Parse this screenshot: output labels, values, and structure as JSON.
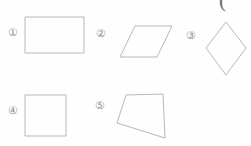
{
  "page": {
    "width": 251,
    "height": 146,
    "background_color": "#fefefe",
    "stroke_color": "#b8b8b8",
    "label_color": "#8f8f8f",
    "partial_glyph_color": "#6a6a6a"
  },
  "partial_mark": {
    "glyph": "(",
    "note": "partial stroke clipped at top edge"
  },
  "labels": {
    "one": "①",
    "two": "②",
    "three": "③",
    "four": "④",
    "five": "⑤"
  },
  "shapes": [
    {
      "id": "shape-1",
      "label": "①",
      "type": "rectangle",
      "points": "25,17 84,17 84,53 25,53"
    },
    {
      "id": "shape-2",
      "label": "②",
      "type": "parallelogram",
      "points": "135,26 172,26 157,57 120,57"
    },
    {
      "id": "shape-3",
      "label": "③",
      "type": "rhombus",
      "points": "226,22 246,48 226,75 206,48"
    },
    {
      "id": "shape-4",
      "label": "④",
      "type": "square",
      "points": "25,95 66,95 66,136 25,136"
    },
    {
      "id": "shape-5",
      "label": "⑤",
      "type": "irregular-quadrilateral",
      "points": "126,95 163,94 165,138 117,123"
    }
  ]
}
